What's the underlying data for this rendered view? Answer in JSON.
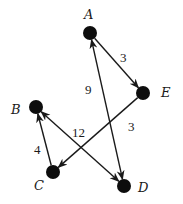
{
  "diagram": {
    "type": "directed-weighted-graph",
    "colors": {
      "ink": "#1a1a1a",
      "node": "#0d0d0d",
      "background": "#ffffff"
    },
    "nodes": [
      {
        "id": "A",
        "label": "A",
        "x": 90,
        "y": 33,
        "lx": 84,
        "ly": 19
      },
      {
        "id": "E",
        "label": "E",
        "x": 143,
        "y": 93,
        "lx": 161,
        "ly": 97
      },
      {
        "id": "B",
        "label": "B",
        "x": 36,
        "y": 107,
        "lx": 11,
        "ly": 114
      },
      {
        "id": "C",
        "label": "C",
        "x": 53,
        "y": 172,
        "lx": 34,
        "ly": 190
      },
      {
        "id": "D",
        "label": "D",
        "x": 124,
        "y": 186,
        "lx": 138,
        "ly": 192
      }
    ],
    "edges": [
      {
        "from": "A",
        "to": "E",
        "weight": "3",
        "arrow_start": false,
        "arrow_end": true,
        "wx": 120,
        "wy": 62
      },
      {
        "from": "E",
        "to": "C",
        "weight": "3",
        "arrow_start": false,
        "arrow_end": true,
        "wx": 128,
        "wy": 131
      },
      {
        "from": "C",
        "to": "B",
        "weight": "4",
        "arrow_start": false,
        "arrow_end": true,
        "wx": 34,
        "wy": 154
      },
      {
        "from": "B",
        "to": "D",
        "weight": "12",
        "arrow_start": true,
        "arrow_end": true,
        "wx": 72,
        "wy": 137
      },
      {
        "from": "D",
        "to": "A",
        "weight": "9",
        "arrow_start": true,
        "arrow_end": true,
        "wx": 85,
        "wy": 94
      }
    ]
  }
}
